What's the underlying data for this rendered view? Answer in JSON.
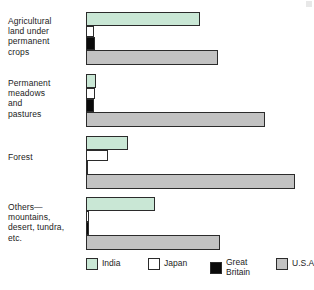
{
  "chart_data": {
    "type": "bar",
    "orientation": "horizontal",
    "title": "",
    "subtitle": "",
    "xlabel": "",
    "ylabel": "",
    "grid": false,
    "legend_position": "bottom",
    "axis_origin_px": 86,
    "categories": [
      "Agricultural land under permanent crops",
      "Permanent meadows and pastures",
      "Forest",
      "Others—mountains, desert, tundra, etc."
    ],
    "series": [
      {
        "name": "India",
        "color": "#c9e7d5",
        "values": [
          114,
          10,
          42,
          69
        ]
      },
      {
        "name": "Japan",
        "color": "#ffffff",
        "values": [
          8,
          9,
          22,
          3
        ]
      },
      {
        "name": "Great Britain",
        "color": "#0a0a0a",
        "values": [
          9,
          8,
          2,
          3
        ]
      },
      {
        "name": "U.S.A.",
        "color": "#c2c2c2",
        "values": [
          132,
          179,
          209,
          134
        ]
      }
    ]
  },
  "groups": [
    {
      "label": "Agricultural\nland under\npermanent\ncrops",
      "label_top": 16,
      "group_top": 12,
      "bars": [
        {
          "series": "india",
          "top": 0,
          "width": 114,
          "height": 14
        },
        {
          "series": "japan",
          "top": 14,
          "width": 8,
          "height": 11
        },
        {
          "series": "britain",
          "top": 25,
          "width": 9,
          "height": 13
        },
        {
          "series": "usa",
          "top": 38,
          "width": 132,
          "height": 15
        }
      ]
    },
    {
      "label": "Permanent\nmeadows\nand\npastures",
      "label_top": 78,
      "group_top": 74,
      "bars": [
        {
          "series": "india",
          "top": 0,
          "width": 10,
          "height": 14
        },
        {
          "series": "japan",
          "top": 14,
          "width": 9,
          "height": 11
        },
        {
          "series": "britain",
          "top": 25,
          "width": 8,
          "height": 13
        },
        {
          "series": "usa",
          "top": 38,
          "width": 179,
          "height": 15
        }
      ]
    },
    {
      "label": "Forest",
      "label_top": 152,
      "group_top": 136,
      "bars": [
        {
          "series": "india",
          "top": 0,
          "width": 42,
          "height": 14
        },
        {
          "series": "japan",
          "top": 14,
          "width": 22,
          "height": 11
        },
        {
          "series": "britain",
          "top": 25,
          "width": 2,
          "height": 13
        },
        {
          "series": "usa",
          "top": 38,
          "width": 209,
          "height": 15
        }
      ]
    },
    {
      "label": "Others—\nmountains,\ndesert, tundra,\netc.",
      "label_top": 202,
      "group_top": 197,
      "bars": [
        {
          "series": "india",
          "top": 0,
          "width": 69,
          "height": 14
        },
        {
          "series": "japan",
          "top": 14,
          "width": 3,
          "height": 11
        },
        {
          "series": "britain",
          "top": 25,
          "width": 3,
          "height": 13
        },
        {
          "series": "usa",
          "top": 38,
          "width": 134,
          "height": 15
        }
      ]
    }
  ],
  "legend": {
    "items": [
      {
        "label": "India",
        "series": "india"
      },
      {
        "label": "Japan",
        "series": "japan"
      },
      {
        "label": "Great\nBritain",
        "series": "britain"
      },
      {
        "label": "U.S.A.",
        "series": "usa"
      }
    ]
  }
}
